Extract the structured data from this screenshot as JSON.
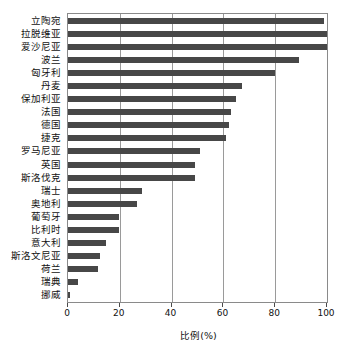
{
  "chart_data": {
    "type": "bar",
    "orientation": "horizontal",
    "title": "",
    "xlabel": "比例(%)",
    "ylabel": "",
    "xlim": [
      0,
      100
    ],
    "xticks": [
      0,
      20,
      40,
      60,
      80,
      100
    ],
    "grid": true,
    "legend": false,
    "bar_color": "#474747",
    "categories": [
      "立陶宛",
      "拉脱维亚",
      "爱沙尼亚",
      "波兰",
      "匈牙利",
      "丹麦",
      "保加利亚",
      "法国",
      "德国",
      "捷克",
      "罗马尼亚",
      "英国",
      "斯洛伐克",
      "瑞士",
      "奥地利",
      "葡萄牙",
      "比利时",
      "意大利",
      "斯洛文尼亚",
      "荷兰",
      "瑞典",
      "挪威"
    ],
    "values": [
      99,
      100,
      100,
      89,
      80,
      67,
      65,
      63,
      62,
      61,
      51,
      49,
      49,
      28.5,
      26.5,
      19.5,
      19.5,
      14.5,
      12.5,
      11.5,
      4,
      0.8
    ]
  }
}
